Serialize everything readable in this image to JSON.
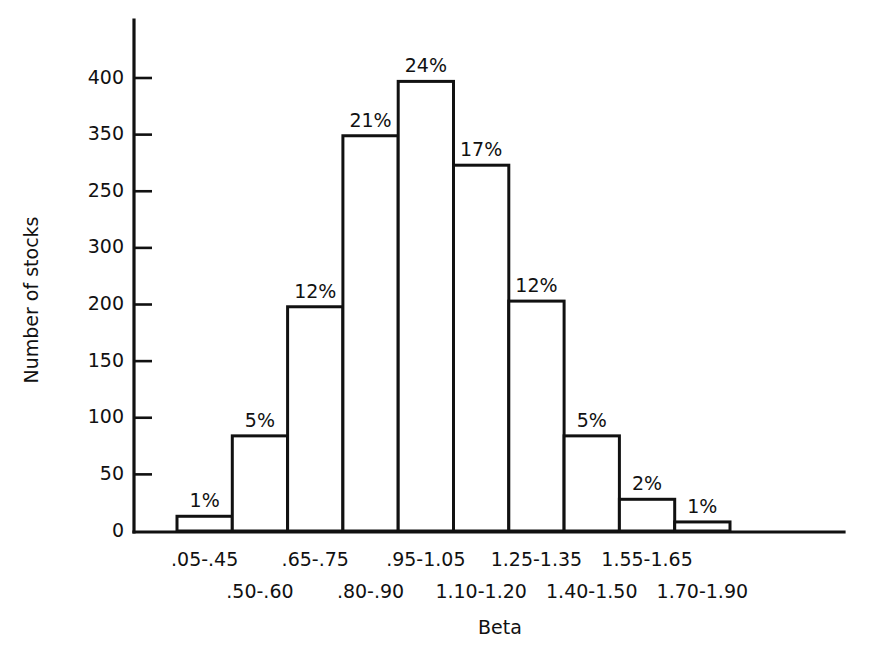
{
  "chart_data": {
    "type": "bar",
    "title": "",
    "subtitle": "",
    "xlabel": "Beta",
    "ylabel": "Number of stocks",
    "categories": [
      ".05-.45",
      ".50-.60",
      ".65-.75",
      ".80-.90",
      ".95-1.05",
      "1.10-1.20",
      "1.25-1.35",
      "1.40-1.50",
      "1.55-1.65",
      "1.70-1.90"
    ],
    "values": [
      13,
      84,
      198,
      349,
      397,
      323,
      203,
      84,
      28,
      8
    ],
    "point_labels": [
      "1%",
      "5%",
      "12%",
      "21%",
      "24%",
      "17%",
      "12%",
      "5%",
      "2%",
      "1%"
    ],
    "ylim": [
      0,
      440
    ],
    "ytick_values": [
      0,
      50,
      100,
      150,
      200,
      250,
      300,
      350,
      400
    ],
    "ytick_labels": [
      "0",
      "50",
      "100",
      "150",
      "200",
      "300",
      "250",
      "350",
      "400"
    ],
    "grid": false,
    "legend": null,
    "legend_position": "none",
    "bar_fill_color": "#ffffff",
    "bar_stroke_color": "#111111",
    "axis_color": "#111111",
    "background_color": "#ffffff",
    "category_label_rows": [
      {
        "row": 0,
        "indices": [
          0,
          2,
          4,
          6,
          8
        ]
      },
      {
        "row": 1,
        "indices": [
          1,
          3,
          5,
          7,
          9
        ]
      }
    ]
  }
}
